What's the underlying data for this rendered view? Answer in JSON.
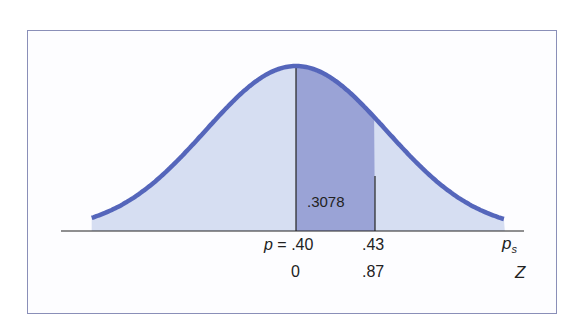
{
  "chart_data": {
    "type": "area",
    "title": "",
    "xlabel": "p_s",
    "secondary_xlabel": "Z",
    "center": {
      "p": 0.4,
      "z": 0
    },
    "marker": {
      "p": 0.43,
      "z": 0.87
    },
    "shaded_area": {
      "from_z": 0,
      "to_z": 0.87,
      "value": ".3078"
    },
    "axis_labels_top": [
      {
        "text": "p = .40",
        "position": 0.4
      },
      {
        "text": ".43",
        "position": 0.43
      },
      {
        "text": "p_s",
        "role": "axis-name"
      }
    ],
    "axis_labels_bottom": [
      {
        "text": "0",
        "position": 0
      },
      {
        "text": ".87",
        "position": 0.87
      },
      {
        "text": "Z",
        "role": "axis-name"
      }
    ],
    "grid": false
  },
  "labels": {
    "area_value": ".3078",
    "p_prefix": "p",
    "p_equals": " = .40",
    "p_marker": ".43",
    "ps_main": "p",
    "ps_sub": "s",
    "z_zero": "0",
    "z_marker": ".87",
    "z_axis": "Z"
  },
  "colors": {
    "curve": "#5566bb",
    "light_fill": "#d6def2",
    "dark_fill": "#9aa3d6",
    "frame": "#8a8fb8",
    "axis": "#222222"
  }
}
